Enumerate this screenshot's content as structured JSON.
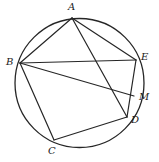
{
  "figure": {
    "type": "geometry-diagram",
    "background_color": "#ffffff",
    "stroke_color": "#262626",
    "label_color": "#1a1a1a",
    "width": 159,
    "height": 162
  },
  "circle": {
    "name": "circumscribed-circle",
    "cx": 79.5,
    "cy": 83,
    "r": 64.5,
    "stroke_width": 1.3
  },
  "points": [
    {
      "id": "A",
      "label": "A",
      "x": 72,
      "y": 18,
      "label_x": 68,
      "label_y": 2,
      "on_circle": true
    },
    {
      "id": "B",
      "label": "B",
      "x": 20,
      "y": 63,
      "label_x": 6,
      "label_y": 57,
      "on_circle": true
    },
    {
      "id": "C",
      "label": "C",
      "x": 54,
      "y": 140,
      "label_x": 48,
      "label_y": 146,
      "on_circle": true
    },
    {
      "id": "D",
      "label": "D",
      "x": 127,
      "y": 117,
      "label_x": 131,
      "label_y": 115,
      "on_circle": true
    },
    {
      "id": "E",
      "label": "E",
      "x": 136,
      "y": 60,
      "label_x": 141,
      "label_y": 52,
      "on_circle": true
    },
    {
      "id": "M",
      "label": "M",
      "x": 134,
      "y": 96,
      "label_x": 139,
      "label_y": 92,
      "on_circle": false
    }
  ],
  "segments": [
    {
      "id": "AB",
      "from": "A",
      "to": "B",
      "label": "A to B"
    },
    {
      "id": "AE",
      "from": "A",
      "to": "E",
      "label": "A to E"
    },
    {
      "id": "AD",
      "from": "A",
      "to": "D",
      "label": "A to D through M"
    },
    {
      "id": "BE",
      "from": "B",
      "to": "E",
      "label": "B to E"
    },
    {
      "id": "BM",
      "from": "B",
      "to": "M",
      "label": "B to M"
    },
    {
      "id": "BC",
      "from": "B",
      "to": "C",
      "label": "B to C"
    },
    {
      "id": "CD",
      "from": "C",
      "to": "D",
      "label": "C to D"
    },
    {
      "id": "ED",
      "from": "E",
      "to": "D",
      "label": "E to D through M"
    }
  ]
}
